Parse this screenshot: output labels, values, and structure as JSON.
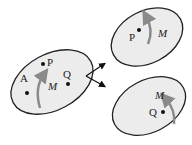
{
  "diagram": {
    "left_region": {
      "points": [
        {
          "label": "A"
        },
        {
          "label": "P"
        },
        {
          "label": "Q"
        }
      ],
      "manifold_label": "M"
    },
    "top_right_region": {
      "points": [
        {
          "label": "P"
        }
      ],
      "manifold_label": "M"
    },
    "bottom_right_region": {
      "points": [
        {
          "label": "Q"
        }
      ],
      "manifold_label": "M"
    },
    "colors": {
      "region_fill": "#ececec",
      "region_stroke": "#222222",
      "arrow_curve": "#8a8a8a",
      "point": "#111111"
    }
  }
}
